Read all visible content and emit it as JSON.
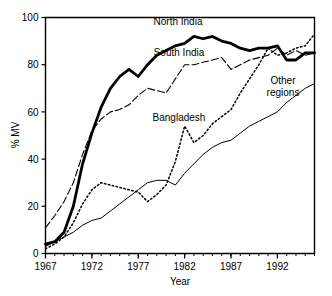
{
  "chart_data": {
    "type": "line",
    "title": "",
    "xlabel": "Year",
    "ylabel": "% MV",
    "xlim": [
      1967,
      1996
    ],
    "ylim": [
      0,
      100
    ],
    "xticks": [
      1967,
      1972,
      1977,
      1982,
      1987,
      1992
    ],
    "xtick_labels": [
      "1967",
      "1972",
      "1977",
      "1982",
      "1987",
      "1992"
    ],
    "xminor_step": 1,
    "yticks": [
      0,
      20,
      40,
      60,
      80,
      100
    ],
    "ytick_labels": [
      "0",
      "20",
      "40",
      "60",
      "80",
      "100"
    ],
    "grid": false,
    "legend": "inline-annotations",
    "x": [
      1967,
      1968,
      1969,
      1970,
      1971,
      1972,
      1973,
      1974,
      1975,
      1976,
      1977,
      1978,
      1979,
      1980,
      1981,
      1982,
      1983,
      1984,
      1985,
      1986,
      1987,
      1988,
      1989,
      1990,
      1991,
      1992,
      1993,
      1994,
      1995,
      1996
    ],
    "series": [
      {
        "name": "North India",
        "style": "thick-solid",
        "color": "#000000",
        "label_x": 1977.4,
        "label_y": 97,
        "values": [
          4,
          5,
          9,
          20,
          38,
          51,
          62,
          70,
          75,
          78,
          75,
          80,
          84,
          86,
          88,
          89,
          92,
          91,
          92,
          90,
          89,
          87,
          86,
          87,
          87,
          88,
          82,
          82,
          85,
          85
        ]
      },
      {
        "name": "South India",
        "style": "dashed",
        "color": "#000000",
        "label_x": 1977.8,
        "label_y": 86,
        "values": [
          11,
          16,
          22,
          30,
          42,
          52,
          57,
          60,
          61,
          63,
          67,
          70,
          69,
          68,
          74,
          80,
          80,
          81,
          82,
          83,
          78,
          80,
          82,
          83,
          84,
          87,
          84,
          86,
          84,
          85
        ]
      },
      {
        "name": "Bangladesh",
        "style": "dotted",
        "color": "#000000",
        "label_x": 1978.0,
        "label_y": 62,
        "values": [
          2,
          4,
          7,
          13,
          21,
          27,
          30,
          29,
          28,
          27,
          26,
          22,
          25,
          29,
          39,
          54,
          47,
          50,
          55,
          58,
          61,
          68,
          74,
          80,
          87,
          84,
          85,
          87,
          88,
          93
        ]
      },
      {
        "name": "Other regions",
        "style": "thin-solid",
        "color": "#000000",
        "label_x": 1990.0,
        "label_y": 76,
        "values": [
          3,
          5,
          7,
          9,
          12,
          14,
          15,
          18,
          21,
          24,
          27,
          30,
          31,
          31,
          29,
          34,
          38,
          42,
          45,
          47,
          48,
          51,
          54,
          56,
          58,
          60,
          64,
          67,
          70,
          72
        ]
      }
    ]
  },
  "labels": {
    "north_india": "North India",
    "south_india": "South India",
    "bangladesh": "Bangladesh",
    "other_regions_line1": "Other",
    "other_regions_line2": "regions",
    "y_axis_title": "% MV",
    "x_axis_title": "Year"
  },
  "caption": {
    "truncated_text": ""
  }
}
